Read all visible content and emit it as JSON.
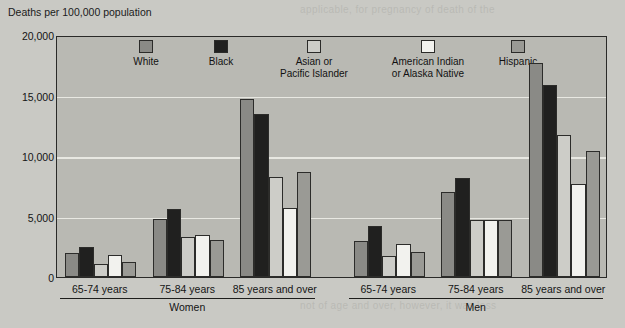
{
  "chart_data": {
    "type": "bar",
    "title": "",
    "ylabel": "Deaths per 100,000 population",
    "xlabel": "",
    "ylim": [
      0,
      20000
    ],
    "yticks": [
      "0",
      "5,000",
      "10,000",
      "15,000",
      "20,000"
    ],
    "ytick_values": [
      0,
      5000,
      10000,
      15000,
      20000
    ],
    "grid": true,
    "legend_position": "inside-top",
    "categories": [
      "65-74 years",
      "75-84 years",
      "85 years and over",
      "65-74 years",
      "75-84 years",
      "85 years and over"
    ],
    "group_labels": [
      "Women",
      "Men"
    ],
    "series": [
      {
        "name": "White",
        "color": "#8a8a86",
        "values": [
          2000,
          4800,
          14700,
          3000,
          7000,
          17700
        ]
      },
      {
        "name": "Black",
        "color": "#20201f",
        "values": [
          2500,
          5600,
          13500,
          4200,
          8200,
          15900
        ]
      },
      {
        "name": "Asian or\nPacific Islander",
        "color": "#cdcdc8",
        "values": [
          1100,
          3300,
          8300,
          1700,
          4700,
          11700
        ]
      },
      {
        "name": "American Indian\nor Alaska Native",
        "color": "#f2f2ee",
        "values": [
          1800,
          3500,
          5700,
          2700,
          4700,
          7700
        ]
      },
      {
        "name": "Hispanic",
        "color": "#9a9a95",
        "values": [
          1200,
          3100,
          8700,
          2100,
          4700,
          10400
        ]
      }
    ]
  },
  "axis": {
    "y_title": "Deaths per 100,000 population"
  },
  "legend": {
    "items": [
      {
        "label": "White",
        "swatch": "#8a8a86"
      },
      {
        "label": "Black",
        "swatch": "#20201f"
      },
      {
        "label": "Asian or\nPacific Islander",
        "swatch": "#cdcdc8"
      },
      {
        "label": "American Indian\nor Alaska Native",
        "swatch": "#f2f2ee"
      },
      {
        "label": "Hispanic",
        "swatch": "#9a9a95"
      }
    ]
  },
  "xaxis": {
    "age_labels": [
      "65-74 years",
      "75-84 years",
      "85 years and over",
      "65-74 years",
      "75-84 years",
      "85 years and over"
    ],
    "sex_labels": [
      "Women",
      "Men"
    ]
  },
  "background_text": [
    "applicable, for pregnancy of death of the",
    "the deaths in any",
    "not decline, however, it was less",
    "not of age and over, however, it was less"
  ]
}
